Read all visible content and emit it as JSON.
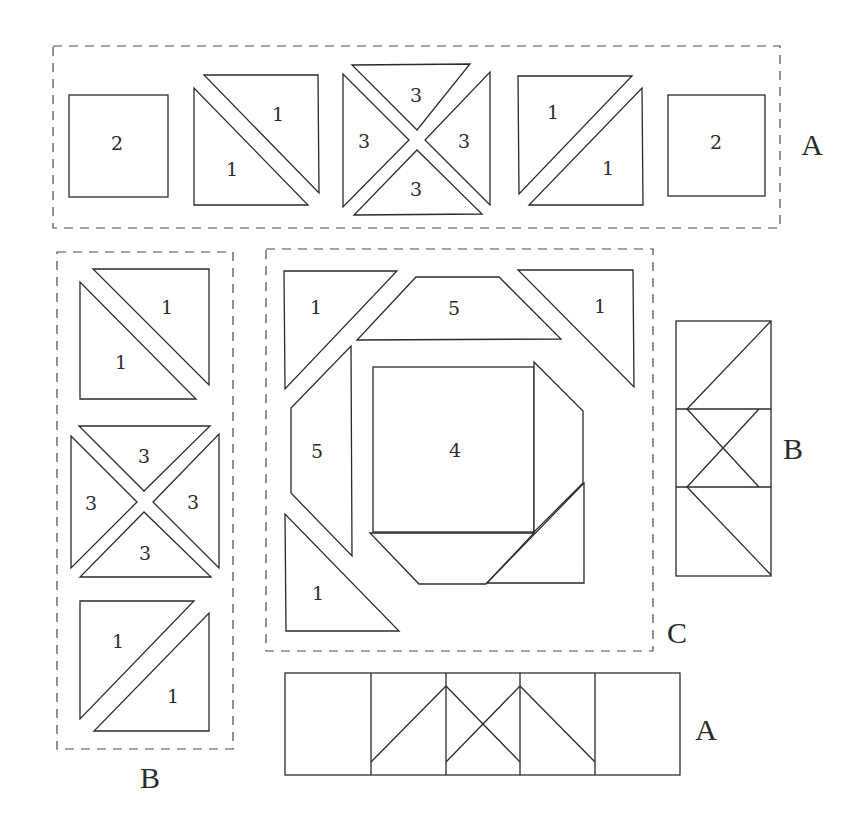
{
  "diagram": {
    "type": "quilt-block-assembly",
    "colors": {
      "stroke": "#2b2b2b",
      "dashed_box": "#4a4a4a",
      "background": "#ffffff"
    },
    "group_labels": {
      "top_row": "A",
      "left_column": "B",
      "center_block": "C",
      "right_strip": "B",
      "bottom_strip": "A"
    },
    "top_row_A": {
      "square_left": "2",
      "hst_left_upper": "1",
      "hst_left_lower": "1",
      "qst_top": "3",
      "qst_left": "3",
      "qst_right": "3",
      "qst_bottom": "3",
      "hst_right_upper": "1",
      "hst_right_lower": "1",
      "square_right": "2"
    },
    "left_column_B": {
      "hst_top_upper": "1",
      "hst_top_lower": "1",
      "qst_top": "3",
      "qst_left": "3",
      "qst_right": "3",
      "qst_bottom": "3",
      "hst_bottom_upper": "1",
      "hst_bottom_lower": "1"
    },
    "center_C": {
      "corner_top_left": "1",
      "trapezoid_top": "5",
      "corner_top_right": "1",
      "trapezoid_left": "5",
      "center_square": "4",
      "corner_bottom_left": "1"
    }
  }
}
